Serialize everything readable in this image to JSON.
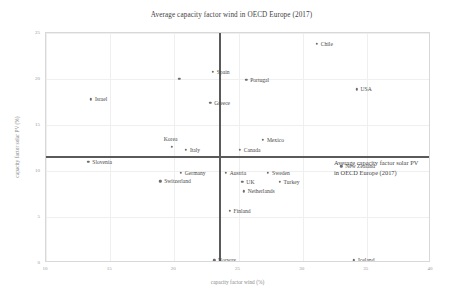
{
  "chart_data": {
    "type": "scatter",
    "title": "Average capacity factor wind in OECD Europe (2017)",
    "xlabel": "capacity factor wind (%)",
    "ylabel": "capacity factor solar PV (%)",
    "xlim": [
      10,
      40
    ],
    "ylim": [
      0,
      25
    ],
    "xticks": [
      10,
      15,
      20,
      25,
      30,
      35,
      40
    ],
    "yticks": [
      0,
      5,
      10,
      15,
      20,
      25
    ],
    "grid": true,
    "legend": "none",
    "reference_lines": {
      "vertical": {
        "value": 23.5,
        "meaning": "Average capacity factor wind in OECD Europe (2017)"
      },
      "horizontal": {
        "value": 11.6,
        "meaning": "Average capacity factor solar PV in OECD Europe (2017)"
      }
    },
    "annotations": [
      {
        "line1": "Average capacity factor solar PV",
        "line2": "in OECD Europe (2017)"
      }
    ],
    "points": [
      {
        "label": "Chile",
        "x": 31.1,
        "y": 23.8,
        "label_pos": "right"
      },
      {
        "label": "Spain",
        "x": 23.0,
        "y": 20.8,
        "label_pos": "right"
      },
      {
        "label": "Portugal",
        "x": 25.6,
        "y": 19.9,
        "label_pos": "right"
      },
      {
        "label": "USA",
        "x": 34.2,
        "y": 18.9,
        "label_pos": "right"
      },
      {
        "label": "Israel",
        "x": 13.5,
        "y": 17.8,
        "label_pos": "right"
      },
      {
        "label": "Greece",
        "x": 22.8,
        "y": 17.4,
        "label_pos": "right"
      },
      {
        "label": "",
        "x": 20.4,
        "y": 20.0,
        "label_pos": "right"
      },
      {
        "label": "Mexico",
        "x": 26.9,
        "y": 13.4,
        "label_pos": "right"
      },
      {
        "label": "Korea",
        "x": 19.8,
        "y": 12.6,
        "label_pos": "above"
      },
      {
        "label": "Italy",
        "x": 20.9,
        "y": 12.3,
        "label_pos": "right"
      },
      {
        "label": "Canada",
        "x": 25.1,
        "y": 12.3,
        "label_pos": "right"
      },
      {
        "label": "Slovenia",
        "x": 13.3,
        "y": 11.0,
        "label_pos": "right"
      },
      {
        "label": "New Zealand",
        "x": 33.0,
        "y": 10.5,
        "label_pos": "right"
      },
      {
        "label": "Germany",
        "x": 20.5,
        "y": 9.8,
        "label_pos": "right"
      },
      {
        "label": "Austria",
        "x": 24.0,
        "y": 9.8,
        "label_pos": "right"
      },
      {
        "label": "Sweden",
        "x": 27.3,
        "y": 9.8,
        "label_pos": "right"
      },
      {
        "label": "Switzerland",
        "x": 18.9,
        "y": 8.9,
        "label_pos": "right"
      },
      {
        "label": "UK",
        "x": 25.3,
        "y": 8.8,
        "label_pos": "right"
      },
      {
        "label": "Turkey",
        "x": 28.2,
        "y": 8.8,
        "label_pos": "right"
      },
      {
        "label": "Netherlands",
        "x": 25.4,
        "y": 7.8,
        "label_pos": "right"
      },
      {
        "label": "Finland",
        "x": 24.3,
        "y": 5.7,
        "label_pos": "right"
      },
      {
        "label": "Norway",
        "x": 23.1,
        "y": 0.3,
        "label_pos": "right"
      },
      {
        "label": "Iceland",
        "x": 34.0,
        "y": 0.3,
        "label_pos": "right"
      }
    ]
  }
}
